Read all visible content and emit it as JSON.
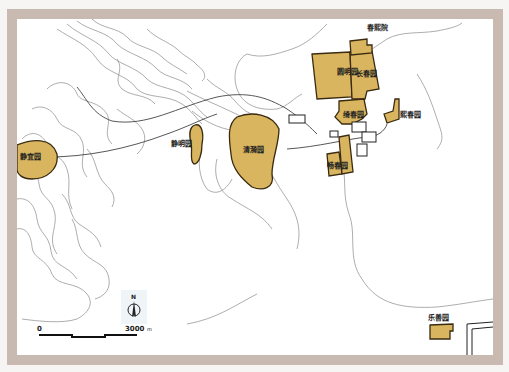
{
  "map": {
    "colors": {
      "garden_fill": "#d8b55e",
      "garden_stroke": "#3a2a10",
      "frame": "#c9bab1",
      "contour": "#8a8a8a",
      "road": "#555555"
    },
    "gardens": [
      {
        "id": "yuanmingyuan",
        "label": "圆明园"
      },
      {
        "id": "changchunyuan",
        "label": "长春园"
      },
      {
        "id": "chunxiyuan",
        "label": "春熙院"
      },
      {
        "id": "qichunyuan",
        "label": "绮春园"
      },
      {
        "id": "xichunyuan",
        "label": "熙春园"
      },
      {
        "id": "changchunyuan2",
        "label": "畅春园"
      },
      {
        "id": "qingyiyuan",
        "label": "清漪园"
      },
      {
        "id": "jingmingyuan",
        "label": "静明园"
      },
      {
        "id": "jingyiyuan",
        "label": "静宜园"
      },
      {
        "id": "leshanyuan",
        "label": "乐善园"
      }
    ],
    "compass": {
      "north_label": "N",
      "icon": "north-arrow-icon"
    },
    "scale_bar": {
      "start_label": "0",
      "end_label": "3000",
      "unit": "m"
    }
  }
}
